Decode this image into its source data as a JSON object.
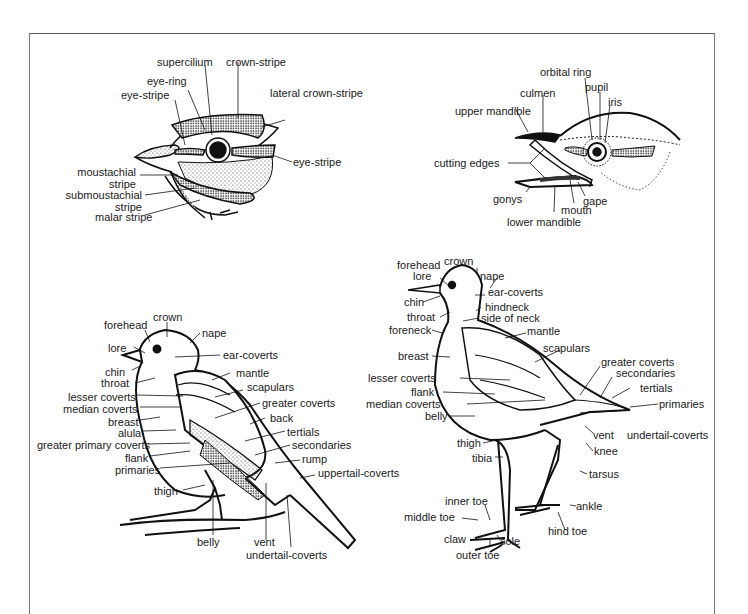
{
  "figure": {
    "panels": [
      {
        "id": "head-markings",
        "labels": {
          "supercilium": "supercilium",
          "crown_stripe": "crown-stripe",
          "eye_ring": "eye-ring",
          "eye_stripe_left": "eye-stripe",
          "lateral_crown_stripe": "lateral crown-stripe",
          "eye_stripe_right": "eye-stripe",
          "moustachial_1": "moustachial",
          "moustachial_2": "stripe",
          "submoustachial_1": "submoustachial",
          "submoustachial_2": "stripe",
          "malar_stripe": "malar stripe"
        }
      },
      {
        "id": "bill-and-eye",
        "labels": {
          "orbital_ring": "orbital ring",
          "pupil": "pupil",
          "culmen": "culmen",
          "iris": "iris",
          "upper_mandible": "upper mandible",
          "cutting_edges": "cutting edges",
          "gonys": "gonys",
          "gape": "gape",
          "mouth": "mouth",
          "lower_mandible": "lower mandible"
        }
      },
      {
        "id": "passerine",
        "labels": {
          "crown": "crown",
          "forehead": "forehead",
          "nape": "nape",
          "lore": "lore",
          "ear_coverts": "ear-coverts",
          "chin": "chin",
          "throat": "throat",
          "mantle": "mantle",
          "scapulars": "scapulars",
          "lesser_coverts": "lesser coverts",
          "median_coverts": "median coverts",
          "greater_coverts": "greater coverts",
          "breast": "breast",
          "back": "back",
          "alula": "alula",
          "tertials": "tertials",
          "greater_primary_coverts": "greater primary coverts",
          "secondaries": "secondaries",
          "flank": "flank",
          "rump": "rump",
          "primaries": "primaries",
          "uppertail_coverts": "uppertail-coverts",
          "thigh": "thigh",
          "belly": "belly",
          "vent": "vent",
          "undertail_coverts": "undertail-coverts"
        }
      },
      {
        "id": "wader",
        "labels": {
          "forehead": "forehead",
          "crown": "crown",
          "lore": "lore",
          "nape": "nape",
          "ear_coverts": "ear-coverts",
          "chin": "chin",
          "hindneck": "hindneck",
          "throat": "throat",
          "side_of_neck": "side of neck",
          "foreneck": "foreneck",
          "mantle": "mantle",
          "scapulars": "scapulars",
          "breast": "breast",
          "greater_coverts": "greater coverts",
          "secondaries": "secondaries",
          "lesser_coverts": "lesser coverts",
          "tertials": "tertials",
          "flank": "flank",
          "primaries": "primaries",
          "median_coverts": "median coverts",
          "belly": "belly",
          "vent": "vent",
          "undertail_coverts": "undertail-coverts",
          "thigh": "thigh",
          "knee": "knee",
          "tibia": "tibia",
          "tarsus": "tarsus",
          "inner_toe": "inner toe",
          "ankle": "ankle",
          "middle_toe": "middle toe",
          "hind_toe": "hind toe",
          "claw": "claw",
          "sole": "sole",
          "outer_toe": "outer toe"
        }
      }
    ]
  }
}
